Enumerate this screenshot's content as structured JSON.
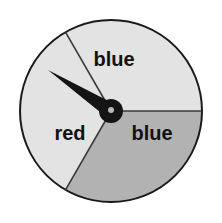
{
  "figure": {
    "kind": "probability-spinner",
    "background_color": "#ffffff"
  },
  "spinner": {
    "outline_color": "#1a1a1a",
    "divider_color": "#3a3a3a",
    "center": {
      "x": 111,
      "y": 111
    },
    "radius": 91,
    "sectors": [
      {
        "id": "sector-top",
        "label": "blue",
        "fill": "#e3e3e3",
        "start_angle_deg": 210,
        "end_angle_deg": 330,
        "label_x": 114,
        "label_y": 61
      },
      {
        "id": "sector-bottom-right",
        "label": "blue",
        "fill": "#e3e3e3",
        "start_angle_deg": 330,
        "end_angle_deg": 90,
        "label_x": 152,
        "label_y": 135
      },
      {
        "id": "sector-left",
        "label": "red",
        "fill": "#b2b2b2",
        "start_angle_deg": 90,
        "end_angle_deg": 210,
        "label_x": 70,
        "label_y": 135
      }
    ]
  },
  "needle": {
    "color": "#141414",
    "tip_x": 48,
    "tip_y": 70,
    "pivot_x": 111,
    "pivot_y": 111,
    "pointing_at": "blue",
    "hub_radius": 12,
    "hub_color": "#141414",
    "hub_dot_color": "#b8b8b8",
    "hub_dot_radius": 3
  },
  "chart_data": {
    "type": "pie",
    "title": "",
    "categories": [
      "blue",
      "blue",
      "red"
    ],
    "values": [
      120,
      120,
      120
    ],
    "labels": [
      "blue",
      "blue",
      "red"
    ],
    "colors": [
      "#e3e3e3",
      "#e3e3e3",
      "#b2b2b2"
    ],
    "units": "degrees",
    "legend": "none"
  }
}
